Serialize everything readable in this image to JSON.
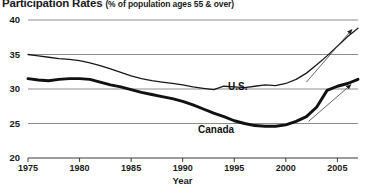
{
  "chart_data": {
    "type": "line",
    "title": "Participation Rates",
    "subtitle": "(% of population ages 55 & over)",
    "xlabel": "Year",
    "ylabel": "",
    "xlim": [
      1975,
      2007
    ],
    "ylim": [
      20,
      40
    ],
    "yticks": [
      20,
      25,
      30,
      35,
      40
    ],
    "xticks": [
      1975,
      1980,
      1985,
      1990,
      1995,
      2000,
      2005
    ],
    "grid": true,
    "legend_position": "inline-annotations",
    "annotations": [
      {
        "text": "U.S.",
        "x": 2000,
        "y": 32.2
      },
      {
        "text": "Canada",
        "x": 1997,
        "y": 25.6
      },
      {
        "text": "trend-arrow-us",
        "x0": 2002,
        "y0": 31.0,
        "x1": 2006.4,
        "y1": 38.6
      },
      {
        "text": "trend-arrow-canada",
        "x0": 2002.2,
        "y0": 25.3,
        "x1": 2006.3,
        "y1": 30.6
      }
    ],
    "series": [
      {
        "name": "U.S.",
        "style": "thin",
        "color": "#1a1a1a",
        "x": [
          1975,
          1976,
          1977,
          1978,
          1979,
          1980,
          1981,
          1982,
          1983,
          1984,
          1985,
          1986,
          1987,
          1988,
          1989,
          1990,
          1991,
          1992,
          1993,
          1994,
          1995,
          1996,
          1997,
          1998,
          1999,
          2000,
          2001,
          2002,
          2003,
          2004,
          2005,
          2006,
          2007
        ],
        "y": [
          35.0,
          34.8,
          34.6,
          34.4,
          34.3,
          34.1,
          33.8,
          33.4,
          32.9,
          32.4,
          31.9,
          31.5,
          31.2,
          31.0,
          30.8,
          30.6,
          30.3,
          30.1,
          29.9,
          30.4,
          30.3,
          30.2,
          30.4,
          30.6,
          30.5,
          30.8,
          31.4,
          32.3,
          33.5,
          34.8,
          36.2,
          37.6,
          38.8
        ]
      },
      {
        "name": "Canada",
        "style": "thick",
        "color": "#111111",
        "x": [
          1975,
          1976,
          1977,
          1978,
          1979,
          1980,
          1981,
          1982,
          1983,
          1984,
          1985,
          1986,
          1987,
          1988,
          1989,
          1990,
          1991,
          1992,
          1993,
          1994,
          1995,
          1996,
          1997,
          1998,
          1999,
          2000,
          2001,
          2002,
          2003,
          2004,
          2005,
          2006,
          2007
        ],
        "y": [
          31.5,
          31.3,
          31.2,
          31.4,
          31.5,
          31.5,
          31.4,
          31.0,
          30.6,
          30.3,
          29.9,
          29.5,
          29.2,
          28.9,
          28.6,
          28.2,
          27.7,
          27.1,
          26.5,
          26.0,
          25.4,
          25.0,
          24.7,
          24.6,
          24.6,
          24.8,
          25.3,
          26.0,
          27.4,
          29.8,
          30.4,
          30.8,
          31.4
        ]
      }
    ]
  },
  "axis": {
    "y_labels": [
      "40",
      "35",
      "30",
      "25",
      "20"
    ],
    "x_labels": [
      "1975",
      "1980",
      "1985",
      "1990",
      "1995",
      "2000",
      "2005"
    ],
    "x_title": "Year"
  },
  "labels": {
    "us": "U.S.",
    "canada": "Canada"
  },
  "title": {
    "main": "Participation Rates",
    "sub": "(% of population ages 55 & over)"
  }
}
